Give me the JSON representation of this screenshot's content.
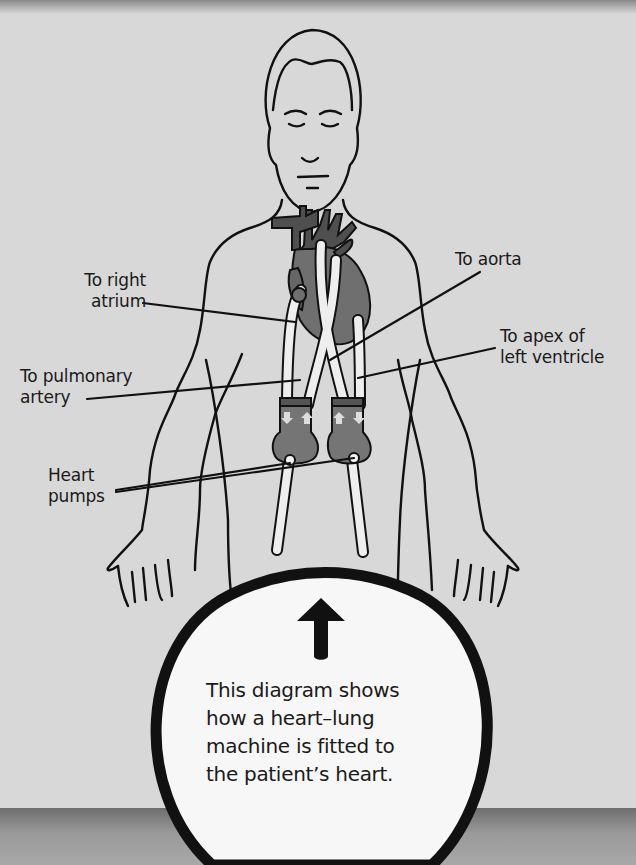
{
  "labels": {
    "right_atrium": [
      "To right",
      "atrium"
    ],
    "pulmonary_artery": [
      "To pulmonary",
      "artery"
    ],
    "heart_pumps": [
      "Heart",
      "pumps"
    ],
    "aorta": [
      "To aorta"
    ],
    "apex": [
      "To apex of",
      "left ventricle"
    ]
  },
  "caption": {
    "lines": [
      "This diagram shows",
      "how a heart–lung",
      "machine is fitted to",
      "the patient’s heart."
    ]
  },
  "icons": {
    "callout_arrow": "up-arrow-icon"
  },
  "colors": {
    "background": "#d8d8d8",
    "outline": "#111111",
    "heart_dark": "#555555",
    "heart_mid": "#7a7a7a",
    "tube": "#eeeeee",
    "callout_fill": "#f7f7f7"
  }
}
